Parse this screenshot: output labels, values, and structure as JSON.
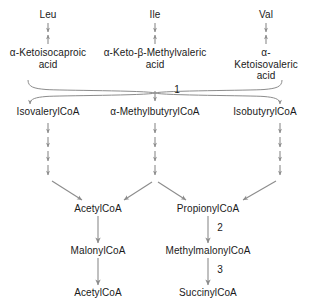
{
  "diagram": {
    "line_color": "#8c8c8c",
    "text_color": "#1a1a1a",
    "background": "#ffffff",
    "nodes": {
      "leu": "Leu",
      "ile": "Ile",
      "val": "Val",
      "ketoisocaproic": "α-Ketoisocaproic\nacid",
      "ketomethylvaleric": "α-Keto-β-Methylvaleric\nacid",
      "ketoisovaleric": "α-Ketoisovaleric\nacid",
      "isovaleryl_coa": "IsovalerylCoA",
      "methylbutyryl_coa": "α-MethylbutyrylCoA",
      "isobutyryl_coa": "IsobutyrylCoA",
      "acetyl_coa_mid": "AcetylCoA",
      "propionyl_coa": "PropionylCoA",
      "malonyl_coa": "MalonylCoA",
      "methylmalonyl_coa": "MethylmalonylCoA",
      "acetyl_coa_bottom": "AcetylCoA",
      "succinyl_coa": "SuccinylCoA"
    },
    "enzyme_labels": {
      "step1": "1",
      "step2": "2",
      "step3": "3"
    }
  }
}
